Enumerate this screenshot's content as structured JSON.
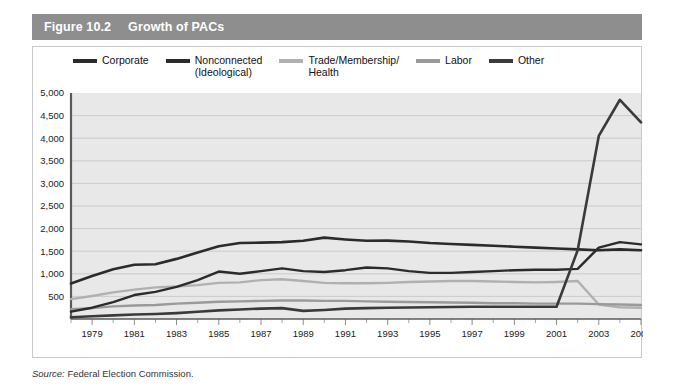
{
  "figure": {
    "number": "Figure 10.2",
    "title": "Growth of PACs",
    "header_bg": "#8e8e8e",
    "header_text_color": "#ffffff"
  },
  "source": {
    "label": "Source:",
    "text": " Federal Election Commission."
  },
  "legend": {
    "position": "top",
    "items": [
      {
        "label": "Corporate",
        "color": "#2b2b2b"
      },
      {
        "label": "Nonconnected\n(Ideological)",
        "color": "#2b2b2b"
      },
      {
        "label": "Trade/Membership/\nHealth",
        "color": "#b0b0b0"
      },
      {
        "label": "Labor",
        "color": "#9a9a9a"
      },
      {
        "label": "Other",
        "color": "#3a3a3a"
      }
    ]
  },
  "chart_data": {
    "type": "line",
    "title": "Growth of PACs",
    "xlabel": "",
    "ylabel": "",
    "grid": true,
    "plot_bg": "#e8e8e8",
    "xlim": [
      1978,
      2005
    ],
    "ylim": [
      0,
      5000
    ],
    "yticks": [
      500,
      1000,
      1500,
      2000,
      2500,
      3000,
      3500,
      4000,
      4500,
      5000
    ],
    "ytick_labels": [
      "500",
      "1,000",
      "1,500",
      "2,000",
      "2,500",
      "3,000",
      "3,500",
      "4,000",
      "4,500",
      "5,000"
    ],
    "x": [
      1978,
      1979,
      1980,
      1981,
      1982,
      1983,
      1984,
      1985,
      1986,
      1987,
      1988,
      1989,
      1990,
      1991,
      1992,
      1993,
      1994,
      1995,
      1996,
      1997,
      1998,
      1999,
      2000,
      2001,
      2002,
      2003,
      2004,
      2005
    ],
    "xtick_labels": [
      "1979",
      "1981",
      "1983",
      "1985",
      "1987",
      "1989",
      "1991",
      "1993",
      "1995",
      "1997",
      "1999",
      "2001",
      "2003",
      "2005"
    ],
    "xticks": [
      1979,
      1981,
      1983,
      1985,
      1987,
      1989,
      1991,
      1993,
      1995,
      1997,
      1999,
      2001,
      2003,
      2005
    ],
    "series": [
      {
        "name": "Corporate",
        "color": "#2b2b2b",
        "width": 2.6,
        "values": [
          785,
          950,
          1100,
          1200,
          1210,
          1330,
          1470,
          1610,
          1680,
          1690,
          1700,
          1730,
          1800,
          1760,
          1730,
          1735,
          1715,
          1680,
          1660,
          1640,
          1620,
          1600,
          1580,
          1560,
          1540,
          1520,
          1540,
          1520
        ]
      },
      {
        "name": "Nonconnected (Ideological)",
        "color": "#2b2b2b",
        "width": 2.4,
        "values": [
          162,
          250,
          375,
          530,
          600,
          710,
          860,
          1050,
          1000,
          1060,
          1120,
          1060,
          1040,
          1080,
          1140,
          1120,
          1060,
          1020,
          1020,
          1040,
          1060,
          1080,
          1090,
          1090,
          1110,
          1580,
          1700,
          1650
        ]
      },
      {
        "name": "Trade/Membership/Health",
        "color": "#b0b0b0",
        "width": 2.4,
        "values": [
          440,
          510,
          590,
          650,
          700,
          720,
          750,
          800,
          810,
          860,
          880,
          840,
          800,
          790,
          790,
          800,
          820,
          830,
          840,
          840,
          830,
          820,
          810,
          820,
          840,
          320,
          260,
          250
        ]
      },
      {
        "name": "Labor",
        "color": "#9a9a9a",
        "width": 2.4,
        "values": [
          218,
          240,
          280,
          300,
          310,
          340,
          360,
          380,
          390,
          400,
          410,
          410,
          400,
          400,
          390,
          380,
          375,
          370,
          365,
          360,
          350,
          350,
          340,
          340,
          340,
          330,
          320,
          310
        ]
      },
      {
        "name": "Other",
        "color": "#3a3a3a",
        "width": 2.6,
        "values": [
          40,
          60,
          80,
          100,
          110,
          130,
          160,
          190,
          210,
          230,
          240,
          180,
          200,
          230,
          240,
          250,
          255,
          260,
          265,
          270,
          270,
          270,
          270,
          270,
          1520,
          4050,
          4850,
          4350
        ]
      }
    ]
  }
}
